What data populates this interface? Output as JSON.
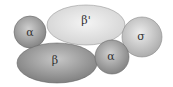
{
  "diagram": {
    "title": "",
    "subunits": [
      {
        "id": "alpha1",
        "label": "α",
        "shape": "circle",
        "cx": 30,
        "cy": 32,
        "rx": 16,
        "ry": 16,
        "color": "#8e8e8e",
        "highlight": "#d0d0d0"
      },
      {
        "id": "beta_prime",
        "label": "β'",
        "shape": "ellipse",
        "cx": 86,
        "cy": 25,
        "rx": 39,
        "ry": 20,
        "color": "#d6d6d6",
        "highlight": "#f4f4f4"
      },
      {
        "id": "sigma",
        "label": "σ",
        "shape": "circle",
        "cx": 142,
        "cy": 37,
        "rx": 20,
        "ry": 20,
        "color": "#b4b4b4",
        "highlight": "#ececec"
      },
      {
        "id": "beta",
        "label": "β",
        "shape": "ellipse",
        "cx": 57,
        "cy": 63,
        "rx": 40,
        "ry": 20,
        "color": "#868686",
        "highlight": "#c6c6c6"
      },
      {
        "id": "alpha2",
        "label": "α",
        "shape": "circle",
        "cx": 112,
        "cy": 57,
        "rx": 17,
        "ry": 17,
        "color": "#8e8e8e",
        "highlight": "#d0d0d0"
      }
    ]
  }
}
